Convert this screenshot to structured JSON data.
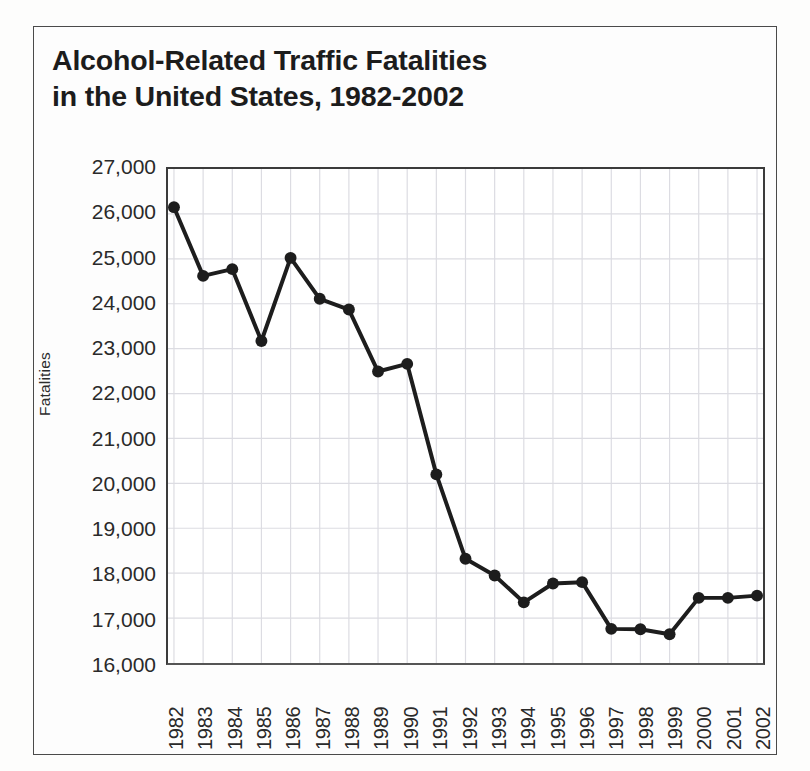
{
  "chart_data": {
    "type": "line",
    "title": "Alcohol-Related Traffic Fatalities in the United States, 1982-2002",
    "title_lines": [
      "Alcohol-Related Traffic Fatalities",
      "in the United States, 1982-2002"
    ],
    "xlabel": "",
    "ylabel": "Fatalities",
    "categories": [
      "1982",
      "1983",
      "1984",
      "1985",
      "1986",
      "1987",
      "1988",
      "1989",
      "1990",
      "1991",
      "1992",
      "1993",
      "1994",
      "1995",
      "1996",
      "1997",
      "1998",
      "1999",
      "2000",
      "2001",
      "2002"
    ],
    "values": [
      26150,
      24620,
      24770,
      23170,
      25020,
      24110,
      23870,
      22490,
      22660,
      20200,
      18320,
      17950,
      17350,
      17770,
      17800,
      16760,
      16750,
      16640,
      17450,
      17450,
      17500
    ],
    "ylim": [
      16000,
      27000
    ],
    "ytick_values": [
      27000,
      26000,
      25000,
      24000,
      23000,
      22000,
      21000,
      20000,
      19000,
      18000,
      17000,
      16000
    ],
    "ytick_labels": [
      "27,000",
      "26,000",
      "25,000",
      "24,000",
      "23,000",
      "22,000",
      "21,000",
      "20,000",
      "19,000",
      "18,000",
      "17,000",
      "16,000"
    ],
    "grid": true,
    "legend": false,
    "legend_position": "none",
    "series_color": "#1d1d1d",
    "grid_color": "#dcdce2",
    "axis_color": "#3b3b3b",
    "marker": "circle",
    "marker_size": 9,
    "line_width": 4
  },
  "figure": {
    "background_color": "#fdfdfd",
    "frame_color": "#4a4a4a"
  }
}
